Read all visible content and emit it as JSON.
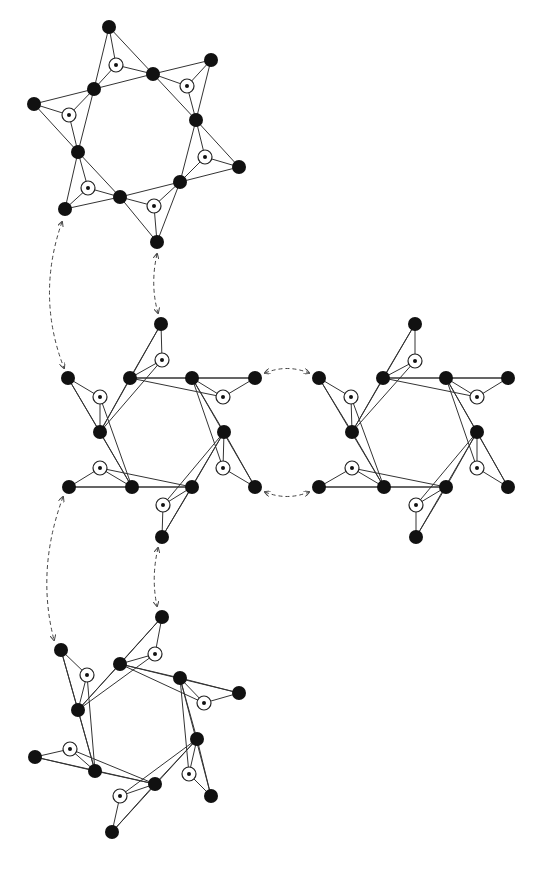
{
  "figure": {
    "width": 538,
    "height": 873,
    "background": "#ffffff",
    "node_color": "#111111",
    "edge_color": "#333333",
    "black_node_radius": 7,
    "open_node_radius": 7,
    "dot_radius": 2
  },
  "clusters": [
    {
      "id": "top",
      "tips": [
        [
          109,
          27
        ],
        [
          211,
          60
        ],
        [
          239,
          167
        ],
        [
          157,
          242
        ],
        [
          65,
          209
        ],
        [
          34,
          104
        ]
      ],
      "hex": [
        [
          153,
          74
        ],
        [
          196,
          120
        ],
        [
          180,
          182
        ],
        [
          120,
          197
        ],
        [
          78,
          152
        ],
        [
          94,
          89
        ]
      ],
      "centers": [
        [
          116,
          65
        ],
        [
          187,
          86
        ],
        [
          205,
          157
        ],
        [
          154,
          206
        ],
        [
          88,
          188
        ],
        [
          69,
          115
        ]
      ]
    },
    {
      "id": "middle-left",
      "tips": [
        [
          161,
          324
        ],
        [
          255,
          378
        ],
        [
          255,
          487
        ],
        [
          162,
          537
        ],
        [
          69,
          487
        ],
        [
          68,
          378
        ]
      ],
      "hex": [
        [
          130,
          378
        ],
        [
          192,
          378
        ],
        [
          224,
          432
        ],
        [
          192,
          487
        ],
        [
          132,
          487
        ],
        [
          100,
          432
        ]
      ],
      "centers": [
        [
          162,
          360
        ],
        [
          223,
          397
        ],
        [
          223,
          468
        ],
        [
          163,
          505
        ],
        [
          100,
          468
        ],
        [
          100,
          397
        ]
      ]
    },
    {
      "id": "middle-right",
      "tips": [
        [
          415,
          324
        ],
        [
          508,
          378
        ],
        [
          508,
          487
        ],
        [
          416,
          537
        ],
        [
          319,
          487
        ],
        [
          319,
          378
        ]
      ],
      "hex": [
        [
          383,
          378
        ],
        [
          446,
          378
        ],
        [
          477,
          432
        ],
        [
          446,
          487
        ],
        [
          384,
          487
        ],
        [
          352,
          432
        ]
      ],
      "centers": [
        [
          415,
          361
        ],
        [
          477,
          397
        ],
        [
          477,
          468
        ],
        [
          416,
          505
        ],
        [
          352,
          468
        ],
        [
          351,
          397
        ]
      ]
    },
    {
      "id": "bottom",
      "tips": [
        [
          162,
          617
        ],
        [
          239,
          693
        ],
        [
          211,
          796
        ],
        [
          112,
          832
        ],
        [
          35,
          757
        ],
        [
          61,
          650
        ]
      ],
      "hex": [
        [
          120,
          664
        ],
        [
          180,
          678
        ],
        [
          197,
          739
        ],
        [
          155,
          784
        ],
        [
          95,
          771
        ],
        [
          78,
          710
        ]
      ],
      "centers": [
        [
          155,
          654
        ],
        [
          204,
          703
        ],
        [
          189,
          774
        ],
        [
          120,
          796
        ],
        [
          70,
          749
        ],
        [
          87,
          675
        ]
      ]
    }
  ],
  "connectors": [
    {
      "id": "top-to-midleft-outer",
      "path": "M 62 222 Q 36 296 64 368"
    },
    {
      "id": "top-to-midleft-inner",
      "path": "M 157 254 Q 150 285 158 313"
    },
    {
      "id": "midleft-to-midright-top",
      "path": "M 265 373 Q 287 364 309 373"
    },
    {
      "id": "midleft-to-midright-bottom",
      "path": "M 265 492 Q 287 501 309 492"
    },
    {
      "id": "midleft-to-bottom-outer",
      "path": "M 63 497 Q 36 570 54 640"
    },
    {
      "id": "midleft-to-bottom-inner",
      "path": "M 158 548 Q 151 578 157 606"
    }
  ]
}
